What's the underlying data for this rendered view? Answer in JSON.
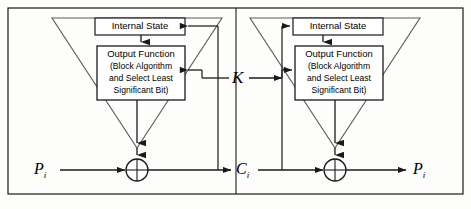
{
  "figure": {
    "kind": "block-diagram",
    "background_color": "#fdfdfb",
    "line_color": "#1a1a1a",
    "box_fill": "#ffffff"
  },
  "encryption_side": {
    "internal_state": {
      "label": "Internal State"
    },
    "output_function": {
      "title": "Output Function",
      "line2": "(Block Algorithm",
      "line3": "and Select Least",
      "line4": "Significant Bit)"
    },
    "input_label": "P",
    "input_sub": "i",
    "output_label": "C",
    "output_sub": "i",
    "xor_symbol": "+"
  },
  "decryption_side": {
    "internal_state": {
      "label": "Internal State"
    },
    "output_function": {
      "title": "Output Function",
      "line2": "(Block Algorithm",
      "line3": "and Select Least",
      "line4": "Significant Bit)"
    },
    "input_label": "C",
    "input_sub": "i",
    "output_label": "P",
    "output_sub": "i",
    "xor_symbol": "+"
  },
  "key": {
    "label": "K"
  }
}
